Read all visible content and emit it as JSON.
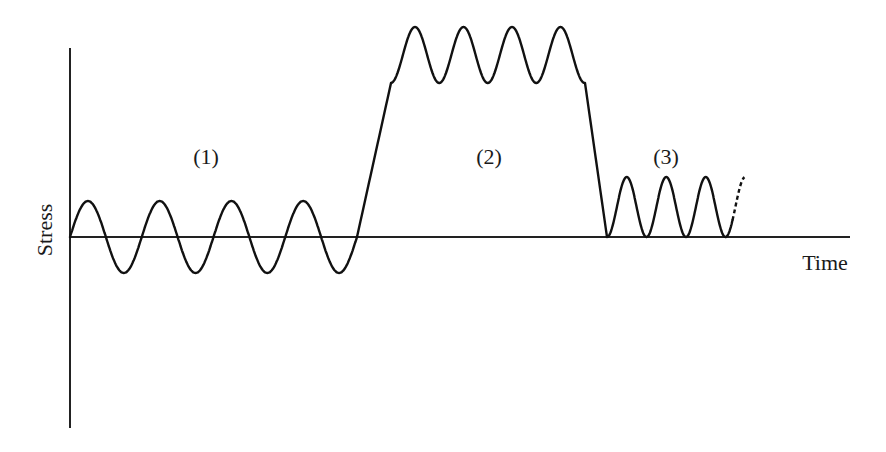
{
  "diagram": {
    "axes": {
      "y_label": "Stress",
      "x_label": "Time"
    },
    "regions": [
      {
        "label": "(1)",
        "description": "Fully reversed sinusoidal stress about zero mean",
        "cycles": 4
      },
      {
        "label": "(2)",
        "description": "Ramp up to high mean stress with superimposed fluctuation, then ramp down",
        "cycles": 4
      },
      {
        "label": "(3)",
        "description": "Repeated (pulsating) stress from zero to maximum, continuing",
        "cycles": 3,
        "continues": true
      }
    ],
    "colors": {
      "line": "#111111",
      "background": "#ffffff"
    }
  }
}
